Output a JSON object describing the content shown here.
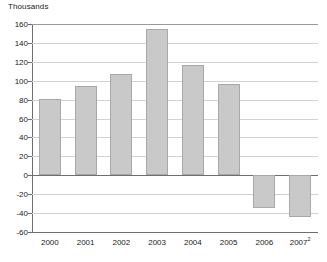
{
  "chart_data": {
    "type": "bar",
    "title": "Thousands",
    "xlabel": "",
    "ylabel": "Thousands",
    "categories": [
      "2000",
      "2001",
      "2002",
      "2003",
      "2004",
      "2005",
      "2006",
      "2007"
    ],
    "category_notes": [
      "",
      "",
      "",
      "",
      "",
      "",
      "",
      "2"
    ],
    "values": [
      81,
      94,
      107,
      155,
      117,
      97,
      -35,
      -44
    ],
    "ylim": [
      -60,
      160
    ],
    "yticks": [
      160,
      140,
      120,
      100,
      80,
      60,
      40,
      20,
      0,
      -20,
      -40,
      -60
    ],
    "ytick_labels": [
      "160",
      "140",
      "120",
      "100",
      "80",
      "60",
      "40",
      "20",
      "0",
      "-20",
      "-40",
      "-60"
    ],
    "grid": true,
    "legend": null,
    "series": [
      {
        "name": "Thousands",
        "values": [
          81,
          94,
          107,
          155,
          117,
          97,
          -35,
          -44
        ]
      }
    ],
    "colors": {
      "bar_fill": "#c9c9c9",
      "bar_border": "#a8a8a8",
      "gridline": "#d2d2d2",
      "axis": "#6e6e6e",
      "text": "#1a1a1a",
      "background": "#ffffff"
    }
  }
}
